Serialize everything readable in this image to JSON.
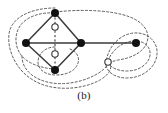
{
  "figure": {
    "caption": "(b)",
    "colors": {
      "background": "#ffffff",
      "edge": "#3b3b3b",
      "node_fill": "#111111",
      "node_stroke": "#111111",
      "open_node_fill": "#ffffff",
      "open_node_stroke": "#333333",
      "contour": "#4a4a4a"
    }
  },
  "chart_data": {
    "type": "diagram",
    "title": "(b)",
    "xlabel": "",
    "ylabel": "",
    "nodes": [
      {
        "id": "n_top",
        "label": "",
        "style": "filled",
        "x": 55,
        "y": 13,
        "r": 4.0
      },
      {
        "id": "n_left",
        "label": "",
        "style": "filled",
        "x": 26,
        "y": 43,
        "r": 4.0
      },
      {
        "id": "n_center",
        "label": "",
        "style": "filled",
        "x": 81,
        "y": 43,
        "r": 4.0
      },
      {
        "id": "n_bottom",
        "label": "",
        "style": "filled",
        "x": 55,
        "y": 70,
        "r": 4.0
      },
      {
        "id": "n_right",
        "label": "",
        "style": "filled",
        "x": 136,
        "y": 43,
        "r": 4.0
      },
      {
        "id": "o_upper",
        "label": "",
        "style": "open",
        "x": 55,
        "y": 27,
        "r": 3.2
      },
      {
        "id": "o_lower",
        "label": "",
        "style": "open",
        "x": 55,
        "y": 54,
        "r": 3.2
      },
      {
        "id": "o_right",
        "label": "",
        "style": "open",
        "x": 108,
        "y": 62,
        "r": 3.2
      }
    ],
    "solid_edges": [
      {
        "from": "n_left",
        "to": "n_top"
      },
      {
        "from": "n_top",
        "to": "n_center"
      },
      {
        "from": "n_left",
        "to": "n_bottom"
      },
      {
        "from": "n_bottom",
        "to": "n_center"
      },
      {
        "from": "n_left",
        "to": "n_center"
      },
      {
        "from": "n_center",
        "to": "n_right"
      }
    ],
    "dashed_edges": [
      {
        "from": "n_top",
        "to": "n_bottom",
        "note": "vertical dashed edge through diamond interior passing two open circles"
      }
    ],
    "contours": [
      {
        "id": "c_diamond_left",
        "note": "dashed loop enclosing the left vertex and diamond"
      },
      {
        "id": "c_small_center",
        "note": "small dashed loop around the lower-center open circle and bottom vertex"
      },
      {
        "id": "c_outer_long",
        "note": "large dashed contour sweeping from the top vertex around to the right open circle"
      },
      {
        "id": "c_outer_wide",
        "note": "widest dashed contour enclosing nearly the whole figure"
      },
      {
        "id": "c_right_inner",
        "note": "dashed loop around the right filled node"
      },
      {
        "id": "c_right_outer",
        "note": "outer dashed loop around the right filled node"
      }
    ]
  }
}
